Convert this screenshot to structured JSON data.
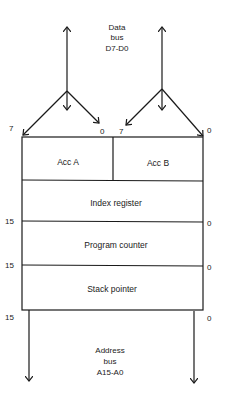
{
  "diagram": {
    "data_bus": {
      "line1": "Data",
      "line2": "bus",
      "line3": "D7-D0"
    },
    "address_bus": {
      "line1": "Address",
      "line2": "bus",
      "line3": "A15-A0"
    },
    "registers": {
      "acc_a": "Acc A",
      "acc_b": "Acc B",
      "index": "Index register",
      "pc": "Program counter",
      "sp": "Stack pointer"
    },
    "bit_labels": {
      "acc_a_msb": "7",
      "acc_a_lsb": "0",
      "acc_b_msb": "7",
      "acc_b_lsb": "0",
      "idx_msb": "15",
      "idx_lsb": "0",
      "pc_msb": "15",
      "pc_lsb": "0",
      "sp_msb": "15",
      "sp_lsb": "0"
    }
  }
}
